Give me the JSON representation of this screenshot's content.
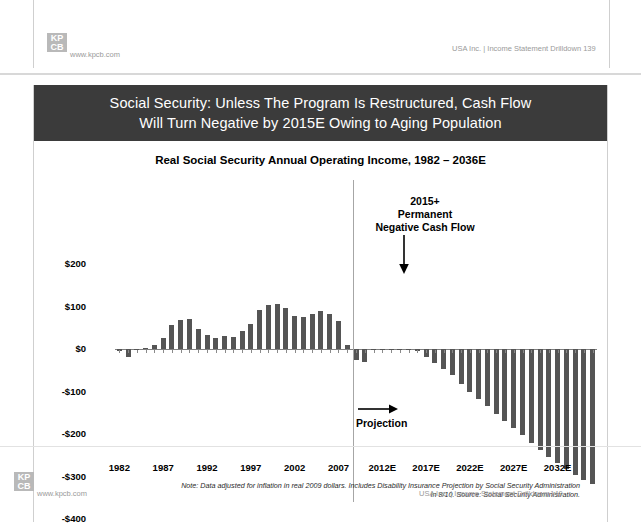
{
  "top_strip": {
    "logo_line1": "KP",
    "logo_line2": "CB",
    "url": "www.kpcb.com",
    "footer_right": "USA Inc. | Income Statement Drilldown   139"
  },
  "slide": {
    "title": "Social Security: Unless The Program Is Restructured, Cash Flow\nWill Turn Negative by 2015E Owing to Aging Population",
    "logo_line1": "KP",
    "logo_line2": "CB",
    "url": "www.kpcb.com",
    "footer_right": "USA Inc. | Income Statement Drilldown   140",
    "footnote": "Note: Data adjusted for inflation in real 2009 dollars.  Includes Disability Insurance  Projection by Social Security Administration\nin 8/10.  Source: Social Security Administration.",
    "projection_label": "Projection",
    "annotation": "2015+\nPermanent\nNegative Cash Flow"
  },
  "chart_data": {
    "type": "bar",
    "title": "Real Social Security Annual Operating Income, 1982 – 2036E",
    "xlabel": "",
    "ylabel": "Annual Social Security Net Cash Flow ($B)",
    "ylim": [
      -400,
      200
    ],
    "ytick_labels": [
      "$200",
      "$100",
      "$0",
      "-$100",
      "-$200",
      "-$300",
      "-$400"
    ],
    "ytick_values": [
      200,
      100,
      0,
      -100,
      -200,
      -300,
      -400
    ],
    "xtick_labels": [
      "1982",
      "1987",
      "1992",
      "1997",
      "2002",
      "2007",
      "2012E",
      "2017E",
      "2022E",
      "2027E",
      "2032E"
    ],
    "xtick_years": [
      1982,
      1987,
      1992,
      1997,
      2002,
      2007,
      2012,
      2017,
      2022,
      2027,
      2032
    ],
    "grid": false,
    "legend": "none",
    "bar_color": "#555555",
    "projection_start_year": 2011,
    "categories": [
      "1982",
      "1983",
      "1984",
      "1985",
      "1986",
      "1987",
      "1988",
      "1989",
      "1990",
      "1991",
      "1992",
      "1993",
      "1994",
      "1995",
      "1996",
      "1997",
      "1998",
      "1999",
      "2000",
      "2001",
      "2002",
      "2003",
      "2004",
      "2005",
      "2006",
      "2007",
      "2008",
      "2009",
      "2010",
      "2011",
      "2012",
      "2013",
      "2014",
      "2015",
      "2016",
      "2017",
      "2018",
      "2019",
      "2020",
      "2021",
      "2022",
      "2023",
      "2024",
      "2025",
      "2026",
      "2027",
      "2028",
      "2029",
      "2030",
      "2031",
      "2032",
      "2033",
      "2034",
      "2035",
      "2036"
    ],
    "values": [
      -4,
      -18,
      -3,
      2,
      10,
      27,
      56,
      68,
      70,
      48,
      33,
      25,
      31,
      29,
      43,
      60,
      92,
      104,
      105,
      96,
      78,
      76,
      82,
      90,
      83,
      66,
      10,
      -25,
      -30,
      -3,
      -2,
      -2,
      0,
      -2,
      -5,
      -18,
      -32,
      -48,
      -62,
      -83,
      -100,
      -118,
      -135,
      -152,
      -170,
      -186,
      -203,
      -220,
      -237,
      -253,
      -268,
      -283,
      -296,
      -308,
      -318
    ]
  }
}
